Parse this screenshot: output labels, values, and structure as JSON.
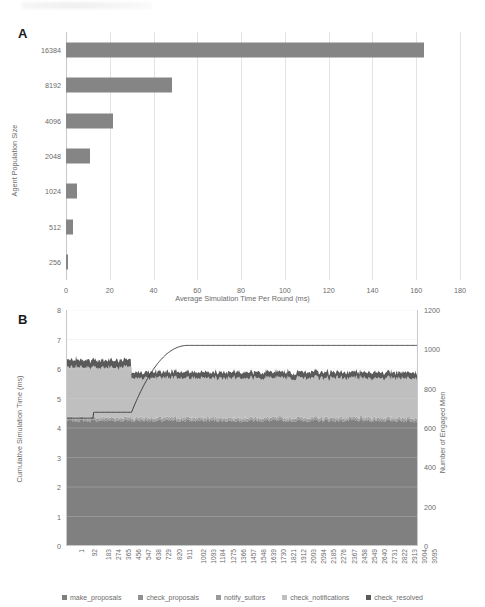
{
  "figure": {
    "panel_a_letter": "A",
    "panel_b_letter": "B"
  },
  "colors": {
    "make_proposals": "#808080",
    "check_proposals": "#909090",
    "notify_suitors": "#9a9a9a",
    "check_notifications": "#bfbfbf",
    "check_resolved": "#5a5a5a",
    "engaged_men_line": "#404040",
    "bar_fill": "#858585",
    "grid": "#e3e3e3",
    "axis": "#c9c9c9",
    "text": "#6b6b6b"
  },
  "chart_data": [
    {
      "type": "bar",
      "panel": "A",
      "orientation": "horizontal",
      "title": "",
      "xlabel": "Average Simulation Time Per Round (ms)",
      "ylabel": "Agent Population Size",
      "categories": [
        "16384",
        "8192",
        "4096",
        "2048",
        "1024",
        "512",
        "256"
      ],
      "values": [
        163.5,
        48.5,
        21.5,
        10.8,
        5.2,
        3.0,
        1.0
      ],
      "xlim": [
        0,
        180
      ],
      "xticks": [
        "0",
        "20",
        "40",
        "60",
        "80",
        "100",
        "120",
        "140",
        "160",
        "180"
      ],
      "xtick_values": [
        0,
        20,
        40,
        60,
        80,
        100,
        120,
        140,
        160,
        180
      ],
      "grid": "vertical",
      "legend": "none"
    },
    {
      "type": "area",
      "panel": "B",
      "stacked": true,
      "title": "",
      "xlabel": "",
      "ylabel": "Cumulative Simulation Time (ms)",
      "y2label": "Number of Engaged Men",
      "ylim": [
        0,
        8
      ],
      "yticks": [
        "0",
        "1",
        "2",
        "3",
        "4",
        "5",
        "6",
        "7",
        "8"
      ],
      "ytick_values": [
        0,
        1,
        2,
        3,
        4,
        5,
        6,
        7,
        8
      ],
      "y2lim": [
        0,
        1200
      ],
      "y2ticks": [
        "0",
        "200",
        "400",
        "600",
        "800",
        "1000",
        "1200"
      ],
      "y2tick_values": [
        0,
        200,
        400,
        600,
        800,
        1000,
        1200
      ],
      "xticks": [
        "1",
        "92",
        "183",
        "274",
        "365",
        "456",
        "547",
        "638",
        "729",
        "820",
        "911",
        "1002",
        "1093",
        "1184",
        "1275",
        "1366",
        "1457",
        "1548",
        "1639",
        "1730",
        "1821",
        "1912",
        "2003",
        "2094",
        "2185",
        "2276",
        "2367",
        "2458",
        "2549",
        "2640",
        "2731",
        "2822",
        "2913",
        "3004",
        "3095"
      ],
      "grid": "horizontal",
      "legend_position": "bottom",
      "series": [
        {
          "name": "make_proposals",
          "color": "#808080",
          "segment1": 4.25,
          "segment2": 4.25
        },
        {
          "name": "check_proposals",
          "color": "#909090",
          "segment1": 0.05,
          "segment2": 0.05
        },
        {
          "name": "notify_suitors",
          "color": "#9a9a9a",
          "segment1": 0.05,
          "segment2": 0.05
        },
        {
          "name": "check_notifications",
          "color": "#bfbfbf",
          "segment1": 1.7,
          "segment2": 1.35
        },
        {
          "name": "check_resolved",
          "color": "#5a5a5a",
          "segment1": 0.25,
          "segment2": 0.2
        }
      ],
      "overlay_line": {
        "name": "Number of Engaged Men",
        "axis": "right",
        "start_value": 650,
        "step_value": 680,
        "plateau_value": 1020,
        "transition_x_index": 6
      },
      "notes": "Stacked area totals ~6.3 ms before round ~500 and ~5.9 ms after; transition occurs near x tick 547."
    }
  ],
  "panelA": {
    "ylabel": "Agent Population Size",
    "xlabel": "Average Simulation Time Per Round (ms)"
  },
  "panelB": {
    "ylabel": "Cumulative Simulation Time (ms)",
    "y2label": "Number of Engaged Men",
    "legend": [
      {
        "label": "make_proposals",
        "color": "#808080"
      },
      {
        "label": "check_proposals",
        "color": "#909090"
      },
      {
        "label": "notify_suitors",
        "color": "#9a9a9a"
      },
      {
        "label": "check_notifications",
        "color": "#bfbfbf"
      },
      {
        "label": "check_resolved",
        "color": "#5a5a5a"
      }
    ]
  }
}
